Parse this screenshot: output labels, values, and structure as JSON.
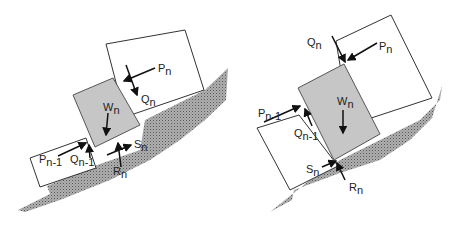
{
  "figure": {
    "colors": {
      "ground": "#9a9a9a",
      "slice": "#c8c8c8",
      "block": "#ffffff",
      "stroke": "#333333"
    },
    "left_panel": {
      "labels": {
        "Pn": {
          "main": "P",
          "sub": "n"
        },
        "Qn": {
          "main": "Q",
          "sub": "n"
        },
        "Wn": {
          "main": "W",
          "sub": "n"
        },
        "Pn1": {
          "main": "P",
          "sub": "n-1"
        },
        "Qn1": {
          "main": "Q",
          "sub": "n-1"
        },
        "Sn": {
          "main": "S",
          "sub": "n"
        },
        "Rn": {
          "main": "R",
          "sub": "n"
        }
      }
    },
    "right_panel": {
      "labels": {
        "Qn": {
          "main": "Q",
          "sub": "n"
        },
        "Pn": {
          "main": "P",
          "sub": "n"
        },
        "Wn": {
          "main": "W",
          "sub": "n"
        },
        "Pn1": {
          "main": "P",
          "sub": "n-1"
        },
        "Qn1": {
          "main": "Q",
          "sub": "n-1"
        },
        "Sn": {
          "main": "S",
          "sub": "n"
        },
        "Rn": {
          "main": "R",
          "sub": "n"
        }
      }
    }
  }
}
